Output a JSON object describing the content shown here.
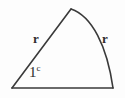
{
  "figure": {
    "type": "geometry-diagram",
    "background_color": "#fdfdfd",
    "stroke_color": "#3a3a3a",
    "text_color": "#2e2e2e",
    "labels": {
      "radius_left": "r",
      "radius_right": "r",
      "angle_value": "1",
      "angle_unit_superscript": "c"
    },
    "geometry": {
      "center_vertex": [
        12,
        88
      ],
      "arc_start": [
        71,
        9
      ],
      "arc_end": [
        113,
        88
      ],
      "arc_control": [
        104,
        30
      ],
      "baseline_start": [
        12,
        88
      ],
      "baseline_end": [
        113,
        88
      ],
      "stroke_width": 1.6
    }
  }
}
